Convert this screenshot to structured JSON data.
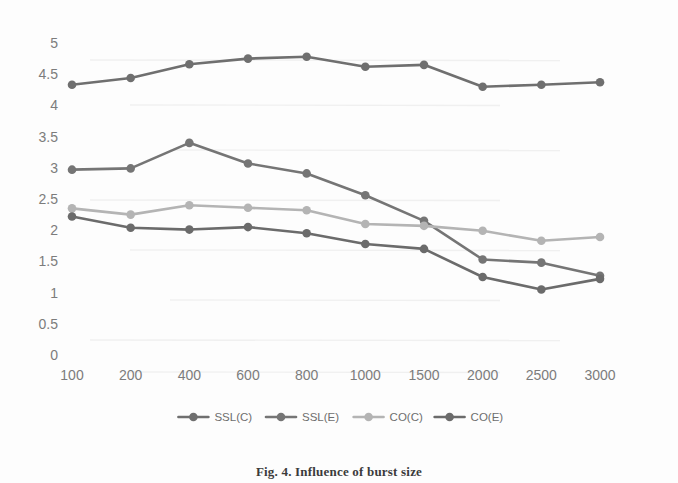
{
  "figure": {
    "caption": "Fig. 4. Influence of burst size"
  },
  "chart_data": {
    "type": "line",
    "title": "",
    "xlabel": "",
    "ylabel": "",
    "categories": [
      "100",
      "200",
      "400",
      "600",
      "800",
      "1000",
      "1500",
      "2000",
      "2500",
      "3000"
    ],
    "ylim": [
      0,
      5
    ],
    "ytick_labels": [
      "5",
      "4.5",
      "4",
      "3.5",
      "3",
      "2.5",
      "2",
      "1.5",
      "1",
      "0.5",
      "0"
    ],
    "ytick_values": [
      5,
      4.5,
      4,
      3.5,
      3,
      2.5,
      2,
      1.5,
      1,
      0.5,
      0
    ],
    "grid": false,
    "legend_position": "bottom",
    "series": [
      {
        "name": "SSL(C)",
        "color": "#6f6f6f",
        "marker": "circle",
        "values": [
          4.33,
          4.44,
          4.66,
          4.75,
          4.78,
          4.62,
          4.65,
          4.3,
          4.33,
          4.37
        ]
      },
      {
        "name": "SSL(E)",
        "color": "#757575",
        "marker": "circle",
        "values": [
          2.97,
          2.99,
          3.4,
          3.07,
          2.91,
          2.56,
          2.15,
          1.53,
          1.48,
          1.27
        ]
      },
      {
        "name": "CO(C)",
        "color": "#b4b4b4",
        "marker": "circle",
        "values": [
          2.35,
          2.25,
          2.4,
          2.36,
          2.32,
          2.1,
          2.07,
          1.99,
          1.83,
          1.89
        ]
      },
      {
        "name": "CO(E)",
        "color": "#6b6b6b",
        "marker": "circle",
        "values": [
          2.22,
          2.04,
          2.01,
          2.05,
          1.95,
          1.78,
          1.7,
          1.25,
          1.05,
          1.22
        ]
      }
    ]
  }
}
